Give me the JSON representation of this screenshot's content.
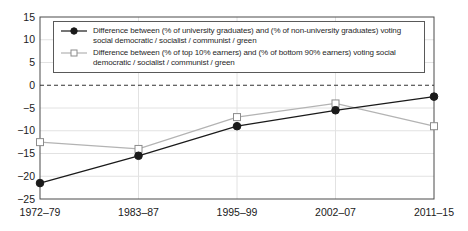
{
  "chart_data": {
    "type": "line",
    "title": "",
    "categories": [
      "1972–79",
      "1983–87",
      "1995–99",
      "2002–07",
      "2011–15"
    ],
    "series": [
      {
        "name": "Difference between (% of university graduates) and (% of non-university graduates) voting social democratic / socialist / communist / green",
        "marker": "filled-circle",
        "color": "#1a1a1a",
        "marker_fill": "#1a1a1a",
        "marker_border": "#1a1a1a",
        "values": [
          -21.5,
          -15.5,
          -9,
          -5.5,
          -2.5
        ]
      },
      {
        "name": "Difference between (% of top 10% earners) and (% of bottom 90% earners) voting social democratic / socialist / communist / green",
        "marker": "open-square",
        "color": "#b3b3b3",
        "marker_fill": "#ffffff",
        "marker_border": "#8c8c8c",
        "values": [
          -12.5,
          -14,
          -7,
          -4,
          -9
        ]
      }
    ],
    "ylim": [
      -25,
      15
    ],
    "yticks": [
      "15",
      "10",
      "5",
      "0",
      "−5",
      "−10",
      "−15",
      "−20",
      "−25"
    ],
    "ytick_values": [
      15,
      10,
      5,
      0,
      -5,
      -10,
      -15,
      -20,
      -25
    ],
    "zero_line": "dashed",
    "grid": true,
    "legend_position": "top-left-inside",
    "colors": {
      "plot_border": "#4a4a4a",
      "gridline": "#e2e2e2",
      "zero_line": "#333333",
      "tick_label": "#1a1a1a"
    }
  }
}
